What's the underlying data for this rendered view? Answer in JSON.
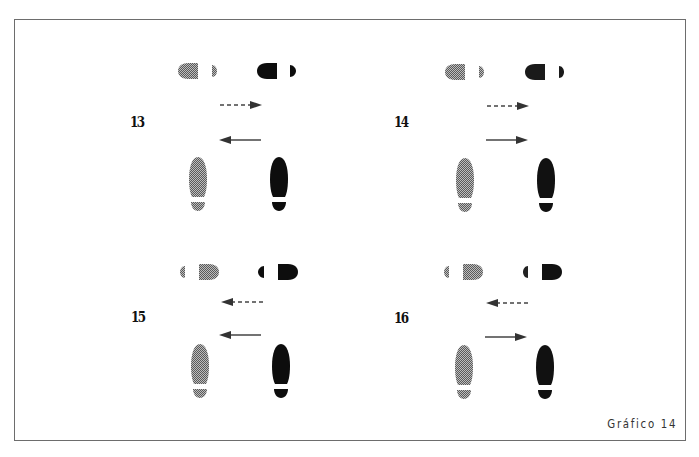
{
  "figure": {
    "caption": "Gráfico 14",
    "colors": {
      "border": "#6d6d6d",
      "grey_print": "#8a8a8a",
      "black_print": "#0d0d0d",
      "arrow": "#444444"
    },
    "legend_semantics": {
      "grey_print": "partner / left dancer footprint",
      "black_print": "dancer footprint",
      "dashed_arrow": "movement of top pair",
      "solid_arrow": "movement of bottom pair"
    }
  },
  "panels": [
    {
      "number": "13",
      "top_prints_facing": "left",
      "bottom_prints_facing": "up",
      "dashed_arrow_direction": "right",
      "solid_arrow_direction": "left"
    },
    {
      "number": "14",
      "top_prints_facing": "left",
      "bottom_prints_facing": "up",
      "dashed_arrow_direction": "right",
      "solid_arrow_direction": "right"
    },
    {
      "number": "15",
      "top_prints_facing": "right",
      "bottom_prints_facing": "up",
      "dashed_arrow_direction": "left",
      "solid_arrow_direction": "left"
    },
    {
      "number": "16",
      "top_prints_facing": "right",
      "bottom_prints_facing": "up",
      "dashed_arrow_direction": "left",
      "solid_arrow_direction": "right"
    }
  ]
}
